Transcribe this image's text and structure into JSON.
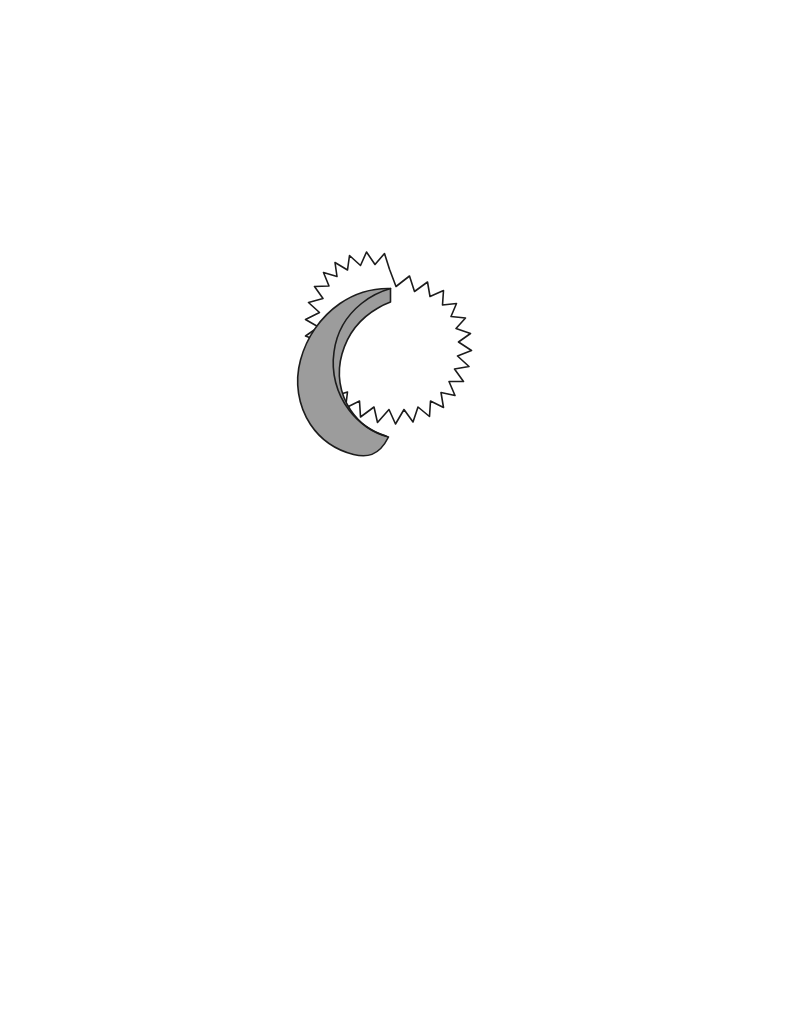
{
  "page": {
    "background_color": "#ffffff",
    "width": 785,
    "height": 1013
  },
  "illustration": {
    "name": "solar-eclipse",
    "description": "Hand-drawn solar eclipse: spiked sun outline partially covered by the moon, leaving a shaded crescent of sunlight on the left side",
    "stroke_color": "#1c1c1c",
    "stroke_width": 1.6,
    "crescent_fill": "#9c9c9c",
    "disc_fill": "#ffffff",
    "center_x": 382,
    "center_y": 363,
    "disc_radius": 78,
    "spike_count": 18,
    "bounds": {
      "left": 283,
      "top": 266,
      "right": 479,
      "bottom": 461
    },
    "sun_outline_path": "M 389.5 269.2 L 396.0 286.5 L 409.5 276.0 L 414.5 291.5 L 427.5 282.0 L 430.0 296.5 L 443.5 290.5 L 442.5 305.0 L 456.5 303.5 L 451.0 316.5 L 465.5 318.0 L 456.0 328.5 L 470.5 333.5 L 458.5 342.0 L 471.5 350.5 L 457.5 356.0 L 469.0 366.5 L 454.5 369.0 L 463.5 381.5 L 449.0 381.5 L 455.0 395.5 L 441.0 392.5 L 443.5 407.5 L 430.5 401.0 L 429.5 416.5 L 418.0 407.0 L 413.0 422.0 L 404.0 409.5 L 395.5 424.0 L 389.0 409.5 L 377.5 422.5 L 374.0 407.0 L 360.5 417.0 L 359.5 401.0 L 345.5 408.0 L 347.5 392.0 L 333.0 396.5 L 337.5 381.0 L 322.5 383.0 L 329.5 368.5 L 314.0 368.0 L 323.5 355.5 L 308.5 352.5 L 320.0 341.5 L 305.5 336.0 L 318.5 327.0 L 305.5 319.5 L 319.5 312.5 L 308.5 302.5 L 323.0 298.5 L 314.5 286.5 L 329.0 286.0 L 323.5 272.5 L 337.0 276.5 L 335.0 262.5 L 347.5 270.0 L 349.5 255.5 L 360.5 265.5 L 366.5 252.0 L 375.0 264.5 L 384.5 253.5 Z",
    "crescent_path": "M 390.5 288.5 C 372.0 288.0 354.5 293.5 340.0 303.5 C 320.5 317.0 306.5 337.5 300.5 360.0 C 294.5 382.0 298.0 405.5 310.5 424.5 C 320.5 439.5 336.0 450.0 353.5 454.5 C 366.0 457.5 378.5 457.0 388.5 437.0 C 373.0 433.0 359.5 423.5 350.5 410.0 C 339.5 393.5 336.5 373.0 342.0 354.0 C 347.5 334.5 360.5 318.0 378.0 308.0 C 382.0 305.5 386.5 303.5 390.5 302.0 Z",
    "terminator_path": "M 390.5 288.5 C 380.0 291.5 370.0 296.5 361.5 303.5 C 346.5 315.5 336.5 333.0 334.0 352.0 C 331.0 372.5 336.5 393.5 349.0 410.0 C 358.5 422.5 371.5 431.5 386.0 436.0"
  }
}
